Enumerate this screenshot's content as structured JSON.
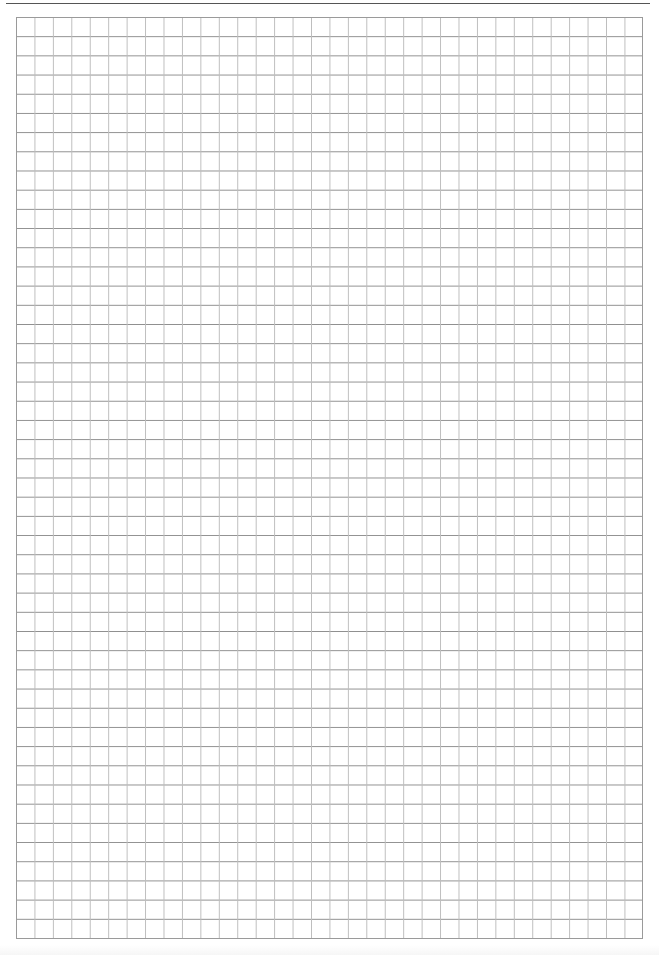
{
  "page": {
    "type": "graph-paper-worksheet",
    "header": {
      "text": "",
      "note": "header text cropped off top edge; only descenders visible"
    },
    "grid": {
      "columns": 34,
      "rows": 48,
      "line_color": "#8e8e8e",
      "minor_line_color": "#bdbdbd",
      "border_color": "#9a9a9a",
      "background": "#ffffff"
    }
  }
}
